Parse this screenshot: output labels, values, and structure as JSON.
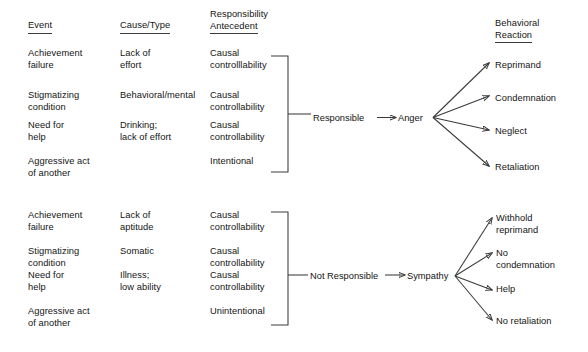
{
  "figure": {
    "background_color": "#ffffff",
    "line_color": "#3a3a3a",
    "text_color": "#141414",
    "width": 588,
    "height": 352
  },
  "headers": {
    "event": "Event",
    "cause_type": "Cause/Type",
    "responsibility_line1": "Responsibility",
    "responsibility_line2": "Antecedent",
    "behavioral_line1": "Behavioral",
    "behavioral_line2": "Reaction"
  },
  "top_block": {
    "events": [
      {
        "line1": "Achievement",
        "line2": "failure"
      },
      {
        "line1": "Stigmatizing",
        "line2": "condition"
      },
      {
        "line1": "Need for",
        "line2": "help"
      },
      {
        "line1": "Aggressive act",
        "line2": "of another"
      }
    ],
    "causes": [
      {
        "line1": "Lack of",
        "line2": "effort"
      },
      {
        "line1": "Behavioral/mental",
        "line2": ""
      },
      {
        "line1": "Drinking;",
        "line2": "lack of effort"
      },
      {
        "line1": "",
        "line2": ""
      }
    ],
    "antecedents": [
      {
        "line1": "Causal",
        "line2": "controlllability"
      },
      {
        "line1": "Causal",
        "line2": "controllability"
      },
      {
        "line1": "Causal",
        "line2": "controllability"
      },
      {
        "line1": "Intentional",
        "line2": ""
      }
    ],
    "judgment": "Responsible",
    "emotion": "Anger",
    "reactions": [
      {
        "line1": "Reprimand",
        "line2": ""
      },
      {
        "line1": "Condemnation",
        "line2": ""
      },
      {
        "line1": "Neglect",
        "line2": ""
      },
      {
        "line1": "Retaliation",
        "line2": ""
      }
    ]
  },
  "bottom_block": {
    "events": [
      {
        "line1": "Achievement",
        "line2": "failure"
      },
      {
        "line1": "Stigmatizing",
        "line2": "condition"
      },
      {
        "line1": "Need for",
        "line2": "help"
      },
      {
        "line1": "Aggressive act",
        "line2": "of another"
      }
    ],
    "causes": [
      {
        "line1": "Lack of",
        "line2": "aptitude"
      },
      {
        "line1": "Somatic",
        "line2": ""
      },
      {
        "line1": "Illness;",
        "line2": "low ability"
      },
      {
        "line1": "",
        "line2": ""
      }
    ],
    "antecedents": [
      {
        "line1": "Causal",
        "line2": "controllability"
      },
      {
        "line1": "Causal",
        "line2": "controllability"
      },
      {
        "line1": "Causal",
        "line2": "controllability"
      },
      {
        "line1": "Unintentional",
        "line2": ""
      }
    ],
    "judgment": "Not Responsible",
    "emotion": "Sympathy",
    "reactions": [
      {
        "line1": "Withhold",
        "line2": "reprimand"
      },
      {
        "line1": "No",
        "line2": "condemnation"
      },
      {
        "line1": "Help",
        "line2": ""
      },
      {
        "line1": "No retaliation",
        "line2": ""
      }
    ]
  }
}
